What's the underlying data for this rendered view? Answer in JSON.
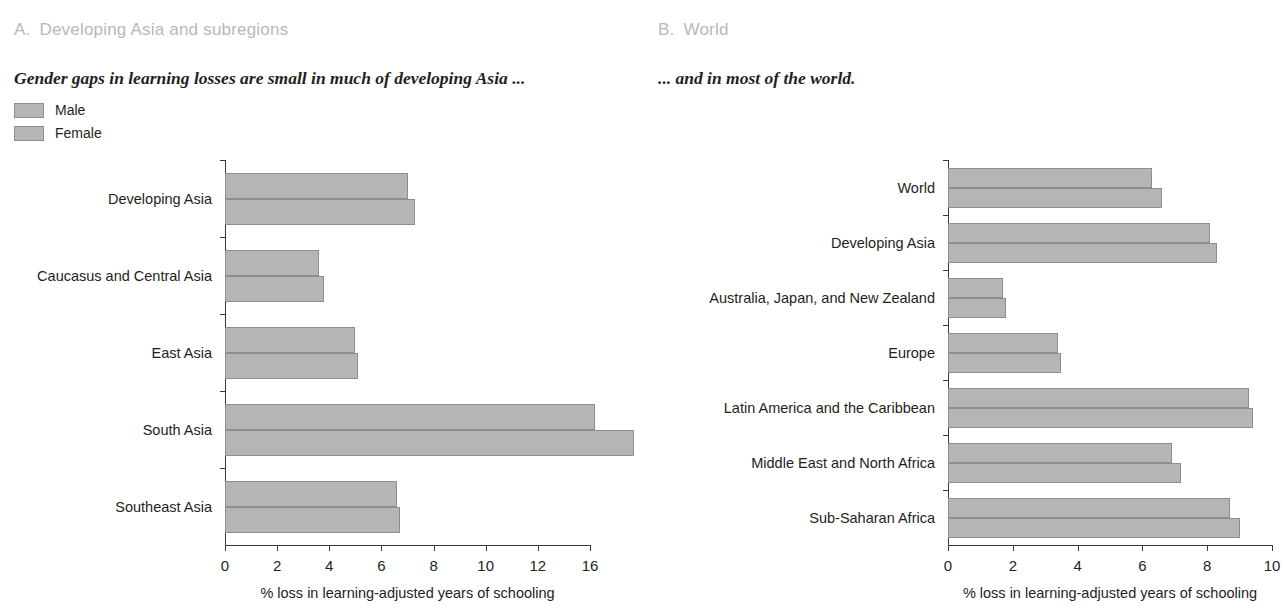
{
  "figure": {
    "legend": {
      "items": [
        {
          "label": "Male",
          "color": "#b5b5b5"
        },
        {
          "label": "Female",
          "color": "#b5b5b5"
        }
      ]
    }
  },
  "panel_a": {
    "letter": "A.",
    "title": "Developing Asia and subregions",
    "subtitle": "Gender gaps in learning losses are small in much of developing Asia ..."
  },
  "panel_b": {
    "letter": "B.",
    "title": "World",
    "subtitle": "... and in most of the world."
  },
  "chart_data": [
    {
      "type": "bar",
      "orientation": "horizontal",
      "panel": "A",
      "title": "Developing Asia and subregions",
      "subtitle": "Gender gaps in learning losses are small in much of developing Asia ...",
      "categories": [
        "Developing Asia",
        "Caucasus and Central Asia",
        "East Asia",
        "South Asia",
        "Southeast Asia"
      ],
      "series": [
        {
          "name": "Male",
          "values": [
            7.0,
            3.6,
            5.0,
            14.2,
            6.6
          ]
        },
        {
          "name": "Female",
          "values": [
            7.3,
            3.8,
            5.1,
            15.7,
            6.7
          ]
        }
      ],
      "xlabel": "% loss in learning-adjusted years of schooling",
      "ylabel": "",
      "xlim": [
        0,
        14
      ],
      "xticks": [
        0,
        2,
        4,
        6,
        8,
        10,
        12,
        14
      ],
      "xticklabels": [
        "0",
        "2",
        "4",
        "6",
        "8",
        "10",
        "12",
        "16"
      ],
      "grid": false,
      "legend_position": "top-left"
    },
    {
      "type": "bar",
      "orientation": "horizontal",
      "panel": "B",
      "title": "World",
      "subtitle": "... and in most of the world.",
      "categories": [
        "World",
        "Developing Asia",
        "Australia, Japan, and New Zealand",
        "Europe",
        "Latin America and the Caribbean",
        "Middle East and North Africa",
        "Sub-Saharan Africa"
      ],
      "series": [
        {
          "name": "Male",
          "values": [
            6.3,
            8.1,
            1.7,
            3.4,
            9.3,
            6.9,
            8.7
          ]
        },
        {
          "name": "Female",
          "values": [
            6.6,
            8.3,
            1.8,
            3.5,
            9.4,
            7.2,
            9.0
          ]
        }
      ],
      "xlabel": "% loss in learning-adjusted years of schooling",
      "ylabel": "",
      "xlim": [
        0,
        10
      ],
      "xticks": [
        0,
        2,
        4,
        6,
        8,
        10
      ],
      "xticklabels": [
        "0",
        "2",
        "4",
        "6",
        "8",
        "10"
      ],
      "grid": false,
      "legend_position": "none"
    }
  ]
}
